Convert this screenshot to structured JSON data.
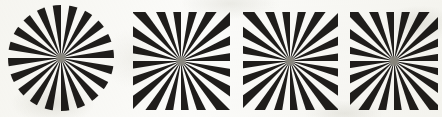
{
  "figure": {
    "background_color": "#fbfbf9",
    "ink_color": "#1f1d1b",
    "hub_color": "#8a8880",
    "panel_count": 4,
    "panels": [
      {
        "id": "panel-1",
        "label": "circular-starburst",
        "shape": "circle",
        "spoke_count": 20,
        "duty_cycle": 0.5,
        "x": 8,
        "y": 5,
        "width": 106,
        "height": 106,
        "center_x": 61,
        "center_y": 58,
        "rotation_deg": 9,
        "hub_radius": 5
      },
      {
        "id": "panel-2",
        "label": "square-starburst-a",
        "shape": "square",
        "spoke_count": 20,
        "duty_cycle": 0.5,
        "x": 133,
        "y": 12,
        "width": 97,
        "height": 98,
        "center_x": 181,
        "center_y": 61,
        "rotation_deg": 9,
        "hub_radius": 5
      },
      {
        "id": "panel-3",
        "label": "square-starburst-b",
        "shape": "square",
        "spoke_count": 20,
        "duty_cycle": 0.5,
        "x": 243,
        "y": 12,
        "width": 95,
        "height": 98,
        "center_x": 290,
        "center_y": 61,
        "rotation_deg": 9,
        "hub_radius": 5
      },
      {
        "id": "panel-4",
        "label": "square-starburst-c",
        "shape": "square",
        "spoke_count": 20,
        "duty_cycle": 0.5,
        "x": 350,
        "y": 12,
        "width": 88,
        "height": 98,
        "center_x": 394,
        "center_y": 61,
        "rotation_deg": 9,
        "hub_radius": 5
      }
    ]
  }
}
